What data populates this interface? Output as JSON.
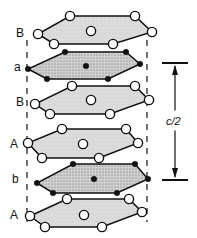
{
  "diagram": {
    "layers": [
      {
        "label": "B",
        "type": "open",
        "fill": "#d6d6d6",
        "vertices": [
          [
            70,
            16
          ],
          [
            135,
            16
          ],
          [
            152,
            32
          ],
          [
            113,
            44
          ],
          [
            54,
            44
          ],
          [
            38,
            34
          ]
        ],
        "center": [
          91,
          31
        ]
      },
      {
        "label": "a",
        "type": "filled",
        "fill": "#bdbdbd",
        "vertices": [
          [
            65,
            52
          ],
          [
            126,
            52
          ],
          [
            140,
            64
          ],
          [
            108,
            79
          ],
          [
            47,
            79
          ],
          [
            28,
            69
          ]
        ],
        "center": [
          86,
          66
        ]
      },
      {
        "label": "B",
        "type": "open",
        "fill": "#d6d6d6",
        "vertices": [
          [
            72,
            86
          ],
          [
            135,
            86
          ],
          [
            149,
            100
          ],
          [
            110,
            114
          ],
          [
            50,
            114
          ],
          [
            35,
            104
          ]
        ],
        "center": [
          91,
          100
        ]
      },
      {
        "label": "A",
        "type": "open",
        "fill": "#d6d6d6",
        "vertices": [
          [
            62,
            129
          ],
          [
            126,
            129
          ],
          [
            138,
            143
          ],
          [
            99,
            158
          ],
          [
            42,
            158
          ],
          [
            28,
            143
          ]
        ],
        "center": [
          83,
          144
        ]
      },
      {
        "label": "b",
        "type": "filled",
        "fill": "#bdbdbd",
        "vertices": [
          [
            73,
            164
          ],
          [
            135,
            164
          ],
          [
            148,
            179
          ],
          [
            117,
            193
          ],
          [
            53,
            193
          ],
          [
            37,
            183
          ]
        ],
        "center": [
          94,
          179
        ]
      },
      {
        "label": "A",
        "type": "open",
        "fill": "#d6d6d6",
        "vertices": [
          [
            67,
            199
          ],
          [
            129,
            199
          ],
          [
            142,
            212
          ],
          [
            102,
            227
          ],
          [
            45,
            227
          ],
          [
            30,
            216
          ]
        ],
        "center": [
          84,
          215
        ]
      }
    ],
    "label_positions": [
      [
        16,
        37
      ],
      [
        14,
        71
      ],
      [
        16,
        106
      ],
      [
        10,
        148
      ],
      [
        12,
        183
      ],
      [
        10,
        219
      ]
    ],
    "dimension": {
      "label": "c/2",
      "x": 175,
      "top": 63,
      "bottom": 180
    },
    "guides": {
      "left_x": 27,
      "right_x": 147,
      "top": 40,
      "bottom": 222
    },
    "colors": {
      "stroke": "#111111",
      "open_atom": "#ffffff",
      "filled_atom": "#111111"
    }
  }
}
